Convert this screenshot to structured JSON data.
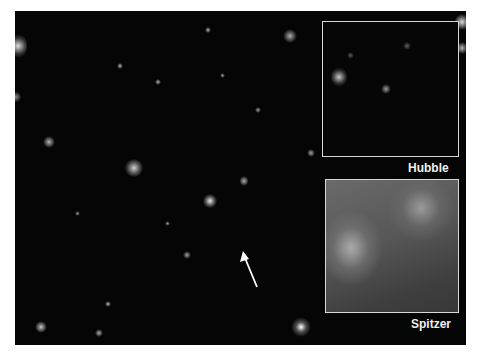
{
  "image": {
    "description": "Deep field astronomical image with two zoomed inset panels comparing telescopes",
    "insets": [
      {
        "label": "Hubble"
      },
      {
        "label": "Spitzer"
      }
    ],
    "arrow": {
      "direction": "up-left",
      "color": "#ffffff"
    },
    "colors": {
      "background": "#050505",
      "inset_border": "#d8d8d8",
      "label": "#f0f0f0"
    }
  }
}
